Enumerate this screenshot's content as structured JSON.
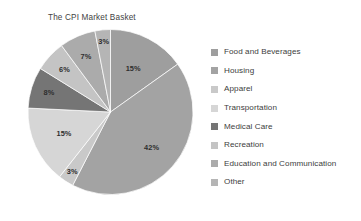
{
  "chart_data": {
    "type": "pie",
    "title": "The CPI Market Basket",
    "xlabel": "",
    "ylabel": "",
    "legend_position": "right",
    "grid": false,
    "start_angle_deg": 0,
    "direction": "clockwise",
    "categories": [
      "Food and Beverages",
      "Housing",
      "Apparel",
      "Transportation",
      "Medical Care",
      "Recreation",
      "Education and Communication",
      "Other"
    ],
    "values": [
      15,
      42,
      3,
      15,
      8,
      6,
      7,
      3
    ],
    "data_labels": [
      "15%",
      "42%",
      "3%",
      "15%",
      "8%",
      "6%",
      "7%",
      "3%"
    ],
    "colors": [
      "#9e9e9e",
      "#a3a3a3",
      "#c9c9c9",
      "#d6d6d6",
      "#757575",
      "#c4c4c4",
      "#ababab",
      "#b5b5b5"
    ],
    "slices": [
      {
        "label": "Food and Beverages",
        "value": 15,
        "display": "15%",
        "color": "#9e9e9e"
      },
      {
        "label": "Housing",
        "value": 42,
        "display": "42%",
        "color": "#a3a3a3"
      },
      {
        "label": "Apparel",
        "value": 3,
        "display": "3%",
        "color": "#c9c9c9"
      },
      {
        "label": "Transportation",
        "value": 15,
        "display": "15%",
        "color": "#d6d6d6"
      },
      {
        "label": "Medical Care",
        "value": 8,
        "display": "8%",
        "color": "#757575"
      },
      {
        "label": "Recreation",
        "value": 6,
        "display": "6%",
        "color": "#c4c4c4"
      },
      {
        "label": "Education and Communication",
        "value": 7,
        "display": "7%",
        "color": "#ababab"
      },
      {
        "label": "Other",
        "value": 3,
        "display": "3%",
        "color": "#b5b5b5"
      }
    ]
  },
  "title": {
    "text": "The CPI Market Basket"
  },
  "legend": {
    "items": [
      {
        "label": "Food and Beverages",
        "color": "#9e9e9e"
      },
      {
        "label": "Housing",
        "color": "#a3a3a3"
      },
      {
        "label": "Apparel",
        "color": "#c9c9c9"
      },
      {
        "label": "Transportation",
        "color": "#d6d6d6"
      },
      {
        "label": "Medical Care",
        "color": "#757575"
      },
      {
        "label": "Recreation",
        "color": "#c4c4c4"
      },
      {
        "label": "Education and Communication",
        "color": "#ababab"
      },
      {
        "label": "Other",
        "color": "#b5b5b5"
      }
    ]
  },
  "slice_labels": {
    "food_and_beverages": "15%",
    "housing": "42%",
    "apparel": "3%",
    "transportation": "15%",
    "medical_care": "8%",
    "recreation": "6%",
    "education_and_communication": "7%",
    "other": "3%"
  }
}
